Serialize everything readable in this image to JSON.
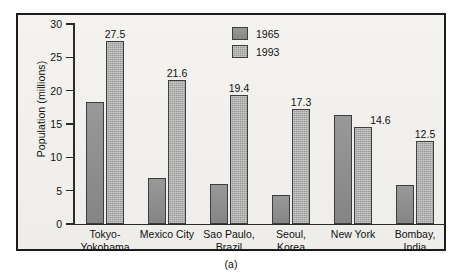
{
  "figure": {
    "caption": "(a)"
  },
  "chart_data": {
    "type": "bar",
    "title": "",
    "xlabel": "",
    "ylabel": "Population (millions)",
    "ylim": [
      0,
      30
    ],
    "yticks": [
      0,
      5,
      10,
      15,
      20,
      25,
      30
    ],
    "ytick_labels": [
      "0",
      "5",
      "10",
      "15",
      "20",
      "25",
      "30"
    ],
    "grid": false,
    "legend_position": "top-center",
    "categories": [
      "Tokyo-\nYokohama",
      "Mexico City",
      "Sao Paulo,\nBrazil",
      "Seoul,\nKorea",
      "New York",
      "Bombay,\nIndia"
    ],
    "category_lines": [
      [
        "Tokyo-",
        "Yokohama"
      ],
      [
        "Mexico City",
        ""
      ],
      [
        "Sao Paulo,",
        "Brazil"
      ],
      [
        "Seoul,",
        "Korea"
      ],
      [
        "New York",
        ""
      ],
      [
        "Bombay,",
        "India"
      ]
    ],
    "series": [
      {
        "name": "1965",
        "color": "#8d8d8d",
        "values": [
          18.3,
          6.9,
          6.0,
          4.4,
          16.4,
          5.8
        ],
        "labels": [
          "",
          "",
          "",
          "",
          "",
          ""
        ]
      },
      {
        "name": "1993",
        "color": "#9a9a9a",
        "values": [
          27.5,
          21.6,
          19.4,
          17.3,
          14.6,
          12.5
        ],
        "labels": [
          "27.5",
          "21.6",
          "19.4",
          "17.3",
          "14.6",
          "12.5"
        ]
      }
    ]
  },
  "legend": {
    "items": [
      {
        "label": "1965",
        "key": "y1965"
      },
      {
        "label": "1993",
        "key": "y1993"
      }
    ]
  }
}
